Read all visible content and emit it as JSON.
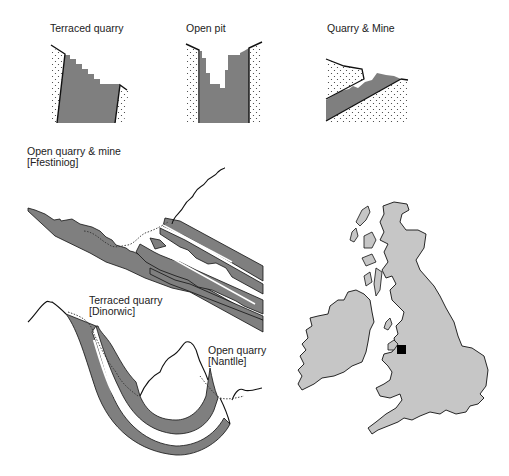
{
  "colors": {
    "rock_fill": "#7f7f7f",
    "land_fill": "#c6c6c6",
    "outline": "#111111",
    "marker": "#000000",
    "background": "#ffffff"
  },
  "panels": {
    "terraced_quarry": {
      "title": "Terraced quarry"
    },
    "open_pit": {
      "title": "Open pit"
    },
    "quarry_mine": {
      "title": "Quarry & Mine"
    }
  },
  "sections": {
    "ffestiniog": {
      "line1": "Open quarry & mine",
      "line2": "[Ffestiniog]"
    },
    "dinorwic": {
      "line1": "Terraced quarry",
      "line2": "[Dinorwic]"
    },
    "nantlle": {
      "line1": "Open quarry",
      "line2": "[Nantlle]"
    }
  },
  "map": {
    "region": "British Isles",
    "marker_label": "North Wales slate region",
    "icon": "square-marker-icon"
  }
}
